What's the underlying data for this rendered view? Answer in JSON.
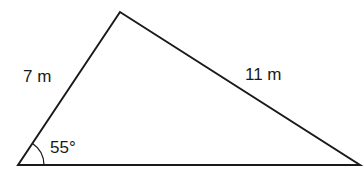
{
  "diagram": {
    "type": "triangle",
    "vertices": {
      "bottom_left": [
        18,
        165
      ],
      "top": [
        120,
        12
      ],
      "bottom_right": [
        360,
        165
      ]
    },
    "labels": {
      "left_side": "7 m",
      "right_side": "11 m",
      "angle": "55°"
    },
    "colors": {
      "stroke": "#1a1a1a",
      "background": "#ffffff"
    }
  }
}
